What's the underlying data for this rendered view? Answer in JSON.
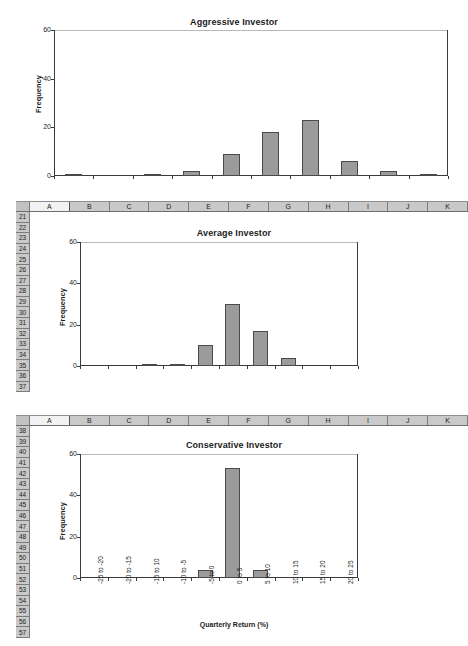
{
  "app": {
    "type": "spreadsheet-with-charts",
    "bar_color": "#9b9b9b",
    "bar_border_color": "#4a4a4a",
    "axis_color": "#3a3a3a",
    "header_bg": "#c9c9c9"
  },
  "spreadsheet": {
    "sections": [
      {
        "name": "average-investor-sheet",
        "columns": [
          "A",
          "B",
          "C",
          "D",
          "E",
          "F",
          "G",
          "H",
          "I",
          "J",
          "K"
        ],
        "selected_column": "A",
        "rows": [
          "21",
          "22",
          "23",
          "24",
          "25",
          "26",
          "27",
          "28",
          "29",
          "30",
          "31",
          "32",
          "33",
          "34",
          "35",
          "36",
          "37"
        ]
      },
      {
        "name": "conservative-investor-sheet",
        "columns": [
          "A",
          "B",
          "C",
          "D",
          "E",
          "F",
          "G",
          "H",
          "I",
          "J",
          "K"
        ],
        "selected_column": "A",
        "rows": [
          "38",
          "39",
          "40",
          "41",
          "42",
          "43",
          "44",
          "45",
          "46",
          "47",
          "48",
          "49",
          "50",
          "51",
          "52",
          "53",
          "54",
          "55",
          "56",
          "57"
        ]
      }
    ]
  },
  "chart_data": [
    {
      "type": "bar",
      "name": "aggressive-investor",
      "title": "Aggressive Investor",
      "xlabel": "",
      "ylabel": "Frequency",
      "ylim": [
        0,
        60
      ],
      "yticks": [
        0,
        20,
        40,
        60
      ],
      "grid": false,
      "legend": false,
      "categories": [
        "-25 to -20",
        "-20 to -15",
        "-15 to -10",
        "-10 to -5",
        "-5 to 0",
        "0 to 5",
        "5 to 10",
        "10 to 15",
        "15 to 20",
        "20 to 25"
      ],
      "values": [
        1,
        0,
        1,
        2,
        9,
        18,
        23,
        6,
        2,
        1
      ],
      "show_xticklabels": false
    },
    {
      "type": "bar",
      "name": "average-investor",
      "title": "Average Investor",
      "xlabel": "",
      "ylabel": "Frequency",
      "ylim": [
        0,
        60
      ],
      "yticks": [
        0,
        20,
        40,
        60
      ],
      "grid": false,
      "legend": false,
      "categories": [
        "-25 to -20",
        "-20 to -15",
        "-15 to -10",
        "-10 to -5",
        "-5 to 0",
        "0 to 5",
        "5 to 10",
        "10 to 15",
        "15 to 20",
        "20 to 25"
      ],
      "values": [
        0,
        0,
        1,
        1,
        10,
        30,
        17,
        4,
        0,
        0
      ],
      "show_xticklabels": false
    },
    {
      "type": "bar",
      "name": "conservative-investor",
      "title": "Conservative Investor",
      "xlabel": "Quarterly Return (%)",
      "ylabel": "Frequency",
      "ylim": [
        0,
        60
      ],
      "yticks": [
        0,
        20,
        40,
        60
      ],
      "grid": false,
      "legend": false,
      "categories": [
        "-25 to -20",
        "-20 to -15",
        "-15 to 10",
        "-10 to -5",
        "-5 to 0",
        "0 to 5",
        "5 to 10",
        "10 to 15",
        "15 to 20",
        "20 to 25"
      ],
      "values": [
        0,
        0,
        0,
        0,
        4,
        53,
        4,
        0,
        0,
        0
      ],
      "show_xticklabels": true
    }
  ]
}
